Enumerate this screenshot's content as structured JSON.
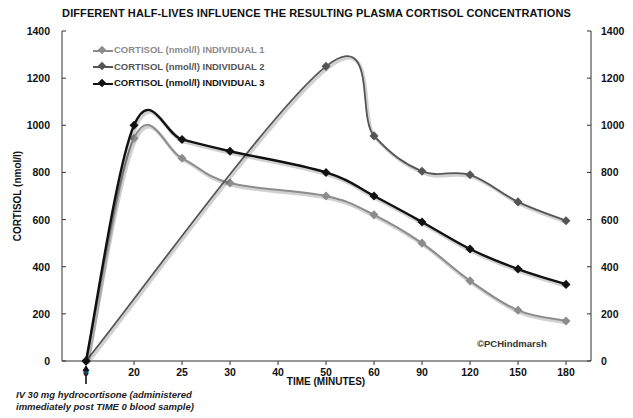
{
  "chart_data": {
    "type": "line",
    "title": "DIFFERENT HALF-LIVES INFLUENCE THE RESULTING PLASMA CORTISOL CONCENTRATIONS",
    "xlabel": "TIME (MINUTES)",
    "ylabel": "CORTISOL (nmol/l)",
    "ylim": [
      0,
      1400
    ],
    "y_ticks": [
      0,
      200,
      400,
      600,
      800,
      1000,
      1200,
      1400
    ],
    "secondary_y_ticks": [
      0,
      200,
      400,
      600,
      800,
      1000,
      1200,
      1400
    ],
    "categories": [
      "0",
      "20",
      "25",
      "30",
      "40",
      "50",
      "60",
      "90",
      "120",
      "150",
      "180"
    ],
    "grid": false,
    "legend_position": "top-left",
    "series": [
      {
        "name": "CORTISOL (nmol/l) INDIVIDUAL 1",
        "color": "#8c8c8c",
        "values": [
          0,
          945,
          860,
          755,
          null,
          700,
          620,
          500,
          340,
          215,
          170
        ]
      },
      {
        "name": "CORTISOL (nmol/l) INDIVIDUAL 2",
        "color": "#555555",
        "values": [
          0,
          null,
          null,
          null,
          null,
          1250,
          955,
          805,
          790,
          675,
          595
        ]
      },
      {
        "name": "CORTISOL (nmol/l) INDIVIDUAL 3",
        "color": "#111111",
        "values": [
          0,
          1000,
          940,
          890,
          null,
          800,
          700,
          590,
          475,
          390,
          325
        ]
      }
    ],
    "annotations": [
      "IV 30 mg hydrocortisone (administered immediately post TIME 0 blood sample)",
      "©PCHindmarsh"
    ]
  },
  "labels": {
    "title": "DIFFERENT HALF-LIVES INFLUENCE THE RESULTING PLASMA CORTISOL CONCENTRATIONS",
    "xlabel": "TIME (MINUTES)",
    "ylabel": "CORTISOL (nmol/l)",
    "copyright": "©PCHindmarsh",
    "note_line1": "IV 30 mg hydrocortisone (administered",
    "note_line2": "immediately post TIME 0 blood sample)",
    "legend": [
      "CORTISOL (nmol/l) INDIVIDUAL 1",
      "CORTISOL (nmol/l) INDIVIDUAL 2",
      "CORTISOL (nmol/l) INDIVIDUAL 3"
    ]
  }
}
